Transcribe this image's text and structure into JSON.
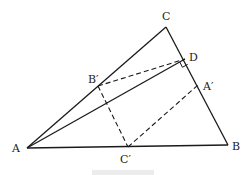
{
  "figure": {
    "points": {
      "A": {
        "label": "A",
        "x": 27,
        "y": 148,
        "label_x": 12,
        "label_y": 152
      },
      "B": {
        "label": "B",
        "x": 228,
        "y": 145,
        "label_x": 232,
        "label_y": 150
      },
      "C": {
        "label": "C",
        "x": 166,
        "y": 27,
        "label_x": 162,
        "label_y": 20
      },
      "D": {
        "label": "D",
        "x": 185,
        "y": 59,
        "label_x": 189,
        "label_y": 61
      },
      "B_prime": {
        "label": "B′",
        "x": 98,
        "y": 86,
        "label_x": 88,
        "label_y": 83
      },
      "A_prime": {
        "label": "A′",
        "x": 198,
        "y": 85,
        "label_x": 203,
        "label_y": 90
      },
      "C_prime": {
        "label": "C′",
        "x": 128,
        "y": 147,
        "label_x": 120,
        "label_y": 163
      }
    },
    "solid_segments": [
      [
        "A",
        "B"
      ],
      [
        "B",
        "C"
      ],
      [
        "C",
        "A"
      ],
      [
        "A",
        "D"
      ]
    ],
    "dashed_segments": [
      [
        "B_prime",
        "D"
      ],
      [
        "B_prime",
        "C_prime"
      ],
      [
        "C_prime",
        "A_prime"
      ]
    ],
    "right_angle_at": "D",
    "caption": ""
  }
}
